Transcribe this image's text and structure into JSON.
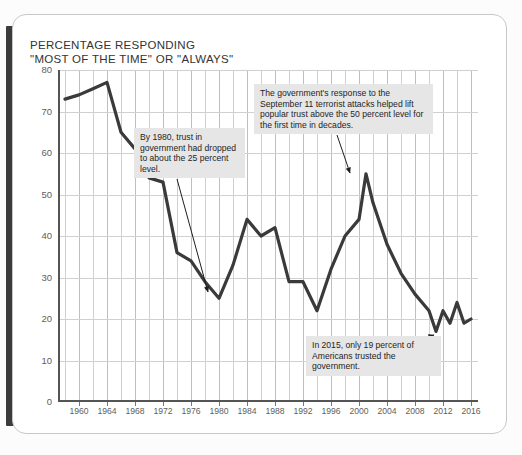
{
  "title": "PERCENTAGE RESPONDING\n\"MOST OF THE TIME\" OR \"ALWAYS\"",
  "title_line1": "PERCENTAGE RESPONDING",
  "title_line2": "\"MOST OF THE TIME\" OR \"ALWAYS\"",
  "annotations": [
    {
      "id": "anno-1980",
      "text": "By 1980, trust in government had dropped to about the 25 percent level."
    },
    {
      "id": "anno-sept11",
      "text": "The government's response to the September 11 terrorist attacks helped lift popular trust above the 50 percent level for the first time in decades."
    },
    {
      "id": "anno-2015",
      "text": "In 2015, only 19 percent of Americans trusted the government."
    }
  ],
  "colors": {
    "line": "#3a3a3a",
    "grid": "#d0d0d0",
    "axis": "#555555",
    "annotation_bg": "#e6e6e6",
    "card_bg": "#ffffff",
    "spine": "#3b3b3b"
  },
  "chart_data": {
    "type": "line",
    "title": "PERCENTAGE RESPONDING \"MOST OF THE TIME\" OR \"ALWAYS\"",
    "xlabel": "",
    "ylabel": "",
    "xlim": [
      1957,
      2017
    ],
    "ylim": [
      0,
      80
    ],
    "yticks": [
      0,
      10,
      20,
      30,
      40,
      50,
      60,
      70,
      80
    ],
    "xticks": [
      1960,
      1964,
      1968,
      1972,
      1976,
      1980,
      1984,
      1988,
      1992,
      1996,
      2000,
      2004,
      2008,
      2012,
      2016
    ],
    "xtick_labels": [
      "1960",
      "1964",
      "1968",
      "1972",
      "1976",
      "1980",
      "1984",
      "1988",
      "1992",
      "1996",
      "2000",
      "2004",
      "2008",
      "2012",
      "2016"
    ],
    "grid": true,
    "gridline_interval_years": 2,
    "legend": null,
    "series": [
      {
        "name": "Trust in government",
        "color": "#3a3a3a",
        "x": [
          1958,
          1960,
          1962,
          1964,
          1966,
          1968,
          1970,
          1972,
          1974,
          1976,
          1978,
          1980,
          1982,
          1984,
          1986,
          1988,
          1990,
          1992,
          1994,
          1996,
          1998,
          2000,
          2001,
          2002,
          2004,
          2006,
          2008,
          2010,
          2011,
          2012,
          2013,
          2014,
          2015,
          2016
        ],
        "y": [
          73,
          74,
          75.5,
          77,
          65,
          61,
          54,
          53,
          36,
          34,
          29,
          25,
          33,
          44,
          40,
          42,
          29,
          29,
          22,
          32,
          40,
          44,
          55,
          48,
          38,
          31,
          26,
          22,
          17,
          22,
          19,
          24,
          19,
          20
        ]
      }
    ]
  }
}
